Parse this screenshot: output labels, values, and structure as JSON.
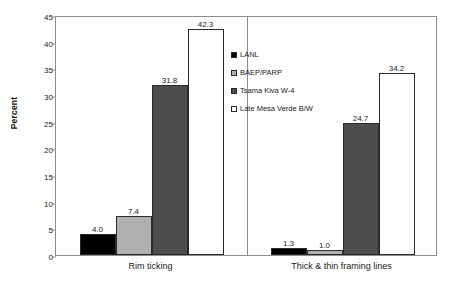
{
  "chart_data": {
    "type": "bar",
    "title": "",
    "subtitle": "",
    "xlabel": "",
    "ylabel": "Percent",
    "ylim": [
      0,
      45
    ],
    "ytick_step": 5,
    "yticks": [
      "0",
      "5",
      "10",
      "15",
      "20",
      "25",
      "30",
      "35",
      "40",
      "45"
    ],
    "grid": false,
    "legend_position": "inside-upper-center",
    "categories": [
      "Rim ticking",
      "Thick & thin framing lines"
    ],
    "series": [
      {
        "name": "LANL",
        "color": "#000000",
        "values": [
          4.0,
          1.3
        ],
        "labels": [
          "4.0",
          "1.3"
        ]
      },
      {
        "name": "BAEP/PARP",
        "color": "#b0b0b0",
        "values": [
          7.4,
          1.0
        ],
        "labels": [
          "7.4",
          "1.0"
        ]
      },
      {
        "name": "Tsama Kiva W-4",
        "color": "#4d4d4d",
        "values": [
          31.8,
          24.7
        ],
        "labels": [
          "31.8",
          "24.7"
        ]
      },
      {
        "name": "Late Mesa Verde B/W",
        "color": "#ffffff",
        "values": [
          42.3,
          34.2
        ],
        "labels": [
          "42.3",
          "34.2"
        ]
      }
    ]
  }
}
